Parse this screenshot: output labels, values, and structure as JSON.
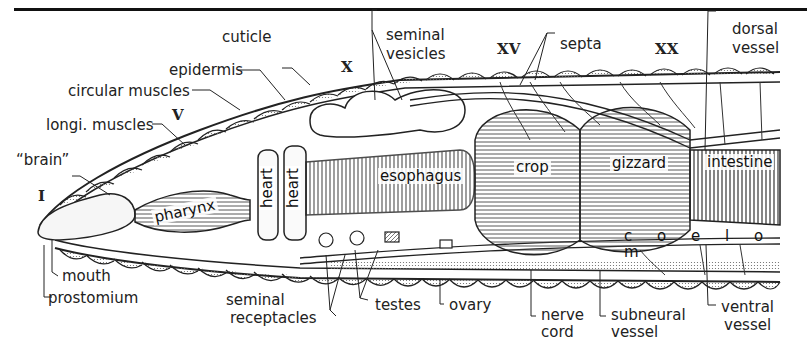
{
  "figure": {
    "segment_markers": [
      "I",
      "V",
      "X",
      "XV",
      "XX"
    ],
    "labels_top": {
      "cuticle": "cuticle",
      "epidermis": "epidermis",
      "circular_muscles": "circular muscles",
      "longi_muscles": "longi. muscles",
      "brain": "“brain”",
      "seminal_vesicles_1": "seminal",
      "seminal_vesicles_2": "vesicles",
      "septa": "septa",
      "dorsal_vessel_1": "dorsal",
      "dorsal_vessel_2": "vessel"
    },
    "labels_inner": {
      "pharynx": "pharynx",
      "heart_1": "heart",
      "heart_2": "heart",
      "esophagus": "esophagus",
      "crop": "crop",
      "gizzard": "gizzard",
      "intestine": "intestine",
      "coelom": "c o e l o m"
    },
    "labels_bottom": {
      "mouth": "mouth",
      "prostomium": "prostomium",
      "seminal_receptacles_1": "seminal",
      "seminal_receptacles_2": "receptacles",
      "testes": "testes",
      "ovary": "ovary",
      "nerve_cord_1": "nerve",
      "nerve_cord_2": "cord",
      "subneural_vessel_1": "subneural",
      "subneural_vessel_2": "vessel",
      "ventral_vessel_1": "ventral",
      "ventral_vessel_2": "vessel"
    }
  }
}
